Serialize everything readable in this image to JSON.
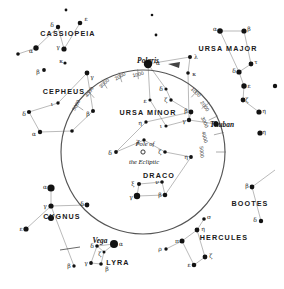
{
  "chart_data": {
    "type": "scatter",
    "xlabel": "",
    "ylabel": "",
    "grid": false,
    "legend_position": "none",
    "precession_circle": {
      "center_label": "Pole of the Ecliptic",
      "center_x": 143,
      "center_y": 152,
      "radius": 82,
      "year_ticks": [
        "1000",
        "2000",
        "3000",
        "4000",
        "5000",
        "2000",
        "3000",
        "4000",
        "5000"
      ]
    },
    "constellations": [
      {
        "name": "CASSIOPEIA",
        "x": 68,
        "y": 33
      },
      {
        "name": "CEPHEUS",
        "x": 64,
        "y": 91
      },
      {
        "name": "URSA MAJOR",
        "x": 228,
        "y": 48
      },
      {
        "name": "URSA MINOR",
        "x": 148,
        "y": 112
      },
      {
        "name": "DRACO",
        "x": 159,
        "y": 175
      },
      {
        "name": "BOOTES",
        "x": 250,
        "y": 203
      },
      {
        "name": "HERCULES",
        "x": 224,
        "y": 237
      },
      {
        "name": "CYGNUS",
        "x": 62,
        "y": 216
      },
      {
        "name": "LYRA",
        "x": 118,
        "y": 262
      }
    ],
    "named_stars": [
      {
        "name": "Polaris",
        "x": 148,
        "y": 60
      },
      {
        "name": "Thuban",
        "x": 222,
        "y": 124
      },
      {
        "name": "Vega",
        "x": 100,
        "y": 240
      }
    ],
    "pole_marker": {
      "label_line1": "Pole of",
      "label_line2": "the Ecliptic",
      "x": 143,
      "y": 152
    },
    "star_labels": [
      {
        "g": "ε",
        "x": 86,
        "y": 18
      },
      {
        "g": "δ",
        "x": 52,
        "y": 24
      },
      {
        "g": "γ",
        "x": 58,
        "y": 46
      },
      {
        "g": "α",
        "x": 31,
        "y": 50
      },
      {
        "g": "κ",
        "x": 61,
        "y": 60
      },
      {
        "g": "β",
        "x": 38,
        "y": 71
      },
      {
        "g": "γ",
        "x": 92,
        "y": 76
      },
      {
        "g": "ι",
        "x": 52,
        "y": 103
      },
      {
        "g": "δ",
        "x": 24,
        "y": 113
      },
      {
        "g": "β",
        "x": 88,
        "y": 113
      },
      {
        "g": "α",
        "x": 34,
        "y": 133
      },
      {
        "g": "α",
        "x": 215,
        "y": 28
      },
      {
        "g": "β",
        "x": 249,
        "y": 28
      },
      {
        "g": "τ",
        "x": 256,
        "y": 61
      },
      {
        "g": "δ",
        "x": 234,
        "y": 70
      },
      {
        "g": "ε",
        "x": 249,
        "y": 85
      },
      {
        "g": "ζ",
        "x": 247,
        "y": 99
      },
      {
        "g": "η",
        "x": 264,
        "y": 110
      },
      {
        "g": "λ",
        "x": 196,
        "y": 56
      },
      {
        "g": "κ",
        "x": 194,
        "y": 73
      },
      {
        "g": "α",
        "x": 158,
        "y": 62
      },
      {
        "g": "δ",
        "x": 161,
        "y": 88
      },
      {
        "g": "ε",
        "x": 145,
        "y": 100
      },
      {
        "g": "ζ",
        "x": 166,
        "y": 99
      },
      {
        "g": "β",
        "x": 186,
        "y": 110
      },
      {
        "g": "γ",
        "x": 184,
        "y": 120
      },
      {
        "g": "η",
        "x": 140,
        "y": 122
      },
      {
        "g": "ι",
        "x": 161,
        "y": 125
      },
      {
        "g": "χ",
        "x": 138,
        "y": 140
      },
      {
        "g": "δ",
        "x": 110,
        "y": 152
      },
      {
        "g": "ζ",
        "x": 160,
        "y": 151
      },
      {
        "g": "η",
        "x": 186,
        "y": 156
      },
      {
        "g": "ξ",
        "x": 133,
        "y": 183
      },
      {
        "g": "ν",
        "x": 157,
        "y": 181
      },
      {
        "g": "γ",
        "x": 131,
        "y": 196
      },
      {
        "g": "β",
        "x": 160,
        "y": 194
      },
      {
        "g": "α",
        "x": 45,
        "y": 186
      },
      {
        "g": "γ",
        "x": 45,
        "y": 205
      },
      {
        "g": "δ",
        "x": 82,
        "y": 203
      },
      {
        "g": "ε",
        "x": 21,
        "y": 228
      },
      {
        "g": "β",
        "x": 69,
        "y": 265
      },
      {
        "g": "α",
        "x": 121,
        "y": 243
      },
      {
        "g": "δ",
        "x": 92,
        "y": 245
      },
      {
        "g": "ζ",
        "x": 100,
        "y": 253
      },
      {
        "g": "γ",
        "x": 86,
        "y": 262
      },
      {
        "g": "β",
        "x": 107,
        "y": 268
      },
      {
        "g": "σ",
        "x": 209,
        "y": 216
      },
      {
        "g": "η",
        "x": 203,
        "y": 228
      },
      {
        "g": "π",
        "x": 177,
        "y": 240
      },
      {
        "g": "ρ",
        "x": 160,
        "y": 248
      },
      {
        "g": "ζ",
        "x": 211,
        "y": 255
      },
      {
        "g": "ε",
        "x": 189,
        "y": 264
      },
      {
        "g": "β",
        "x": 247,
        "y": 185
      },
      {
        "g": "δ",
        "x": 255,
        "y": 219
      },
      {
        "g": "η",
        "x": 264,
        "y": 131
      }
    ],
    "stars": [
      {
        "x": 80,
        "y": 23,
        "m": 2.3
      },
      {
        "x": 58,
        "y": 27,
        "m": 2.2
      },
      {
        "x": 64,
        "y": 49,
        "m": 2.6
      },
      {
        "x": 36,
        "y": 48,
        "m": 2.7
      },
      {
        "x": 65,
        "y": 63,
        "m": 1.6
      },
      {
        "x": 18,
        "y": 54,
        "m": 1.8
      },
      {
        "x": 44,
        "y": 70,
        "m": 1.9
      },
      {
        "x": 87,
        "y": 73,
        "m": 2.4
      },
      {
        "x": 58,
        "y": 103,
        "m": 1.7
      },
      {
        "x": 29,
        "y": 112,
        "m": 2.1
      },
      {
        "x": 93,
        "y": 111,
        "m": 2.0
      },
      {
        "x": 40,
        "y": 132,
        "m": 2.2
      },
      {
        "x": 72,
        "y": 131,
        "m": 1.8
      },
      {
        "x": 220,
        "y": 31,
        "m": 2.8
      },
      {
        "x": 244,
        "y": 31,
        "m": 2.6
      },
      {
        "x": 251,
        "y": 64,
        "m": 2.4
      },
      {
        "x": 239,
        "y": 72,
        "m": 2.6
      },
      {
        "x": 244,
        "y": 86,
        "m": 2.7
      },
      {
        "x": 243,
        "y": 100,
        "m": 2.4
      },
      {
        "x": 259,
        "y": 112,
        "m": 2.6
      },
      {
        "x": 190,
        "y": 57,
        "m": 2.0
      },
      {
        "x": 188,
        "y": 73,
        "m": 1.8
      },
      {
        "x": 148,
        "y": 64,
        "m": 4.2
      },
      {
        "x": 166,
        "y": 89,
        "m": 1.6
      },
      {
        "x": 150,
        "y": 100,
        "m": 1.6
      },
      {
        "x": 171,
        "y": 100,
        "m": 1.7
      },
      {
        "x": 191,
        "y": 112,
        "m": 2.4
      },
      {
        "x": 189,
        "y": 120,
        "m": 2.2
      },
      {
        "x": 146,
        "y": 122,
        "m": 1.7
      },
      {
        "x": 166,
        "y": 126,
        "m": 1.6
      },
      {
        "x": 144,
        "y": 140,
        "m": 1.7
      },
      {
        "x": 116,
        "y": 152,
        "m": 1.9
      },
      {
        "x": 165,
        "y": 152,
        "m": 1.8
      },
      {
        "x": 191,
        "y": 157,
        "m": 1.9
      },
      {
        "x": 216,
        "y": 124,
        "m": 2.7
      },
      {
        "x": 139,
        "y": 184,
        "m": 2.0
      },
      {
        "x": 162,
        "y": 182,
        "m": 1.8
      },
      {
        "x": 137,
        "y": 196,
        "m": 3.2
      },
      {
        "x": 165,
        "y": 195,
        "m": 2.3
      },
      {
        "x": 51,
        "y": 188,
        "m": 3.6
      },
      {
        "x": 51,
        "y": 206,
        "m": 2.6
      },
      {
        "x": 51,
        "y": 218,
        "m": 3.0
      },
      {
        "x": 87,
        "y": 205,
        "m": 2.4
      },
      {
        "x": 26,
        "y": 229,
        "m": 2.6
      },
      {
        "x": 74,
        "y": 266,
        "m": 1.7
      },
      {
        "x": 114,
        "y": 244,
        "m": 4.0
      },
      {
        "x": 97,
        "y": 246,
        "m": 1.8
      },
      {
        "x": 104,
        "y": 252,
        "m": 1.5
      },
      {
        "x": 91,
        "y": 263,
        "m": 1.9
      },
      {
        "x": 101,
        "y": 264,
        "m": 1.8
      },
      {
        "x": 204,
        "y": 219,
        "m": 1.8
      },
      {
        "x": 197,
        "y": 230,
        "m": 2.4
      },
      {
        "x": 182,
        "y": 241,
        "m": 2.5
      },
      {
        "x": 166,
        "y": 249,
        "m": 1.7
      },
      {
        "x": 205,
        "y": 257,
        "m": 2.4
      },
      {
        "x": 194,
        "y": 265,
        "m": 2.3
      },
      {
        "x": 252,
        "y": 187,
        "m": 2.4
      },
      {
        "x": 261,
        "y": 221,
        "m": 2.2
      },
      {
        "x": 260,
        "y": 133,
        "m": 2.6
      },
      {
        "x": 275,
        "y": 86,
        "m": 2.2
      },
      {
        "x": 66,
        "y": 10,
        "m": 1.4
      },
      {
        "x": 152,
        "y": 15,
        "m": 1.3
      },
      {
        "x": 156,
        "y": 35,
        "m": 1.4
      }
    ],
    "constellation_lines": [
      [
        [
          80,
          23
        ],
        [
          64,
          49
        ]
      ],
      [
        [
          64,
          49
        ],
        [
          58,
          27
        ]
      ],
      [
        [
          58,
          27
        ],
        [
          36,
          48
        ]
      ],
      [
        [
          36,
          48
        ],
        [
          18,
          54
        ]
      ],
      [
        [
          220,
          31
        ],
        [
          244,
          31
        ]
      ],
      [
        [
          244,
          31
        ],
        [
          251,
          64
        ]
      ],
      [
        [
          251,
          64
        ],
        [
          239,
          72
        ]
      ],
      [
        [
          239,
          72
        ],
        [
          220,
          31
        ]
      ],
      [
        [
          239,
          72
        ],
        [
          244,
          86
        ]
      ],
      [
        [
          244,
          86
        ],
        [
          243,
          100
        ]
      ],
      [
        [
          243,
          100
        ],
        [
          259,
          112
        ]
      ],
      [
        [
          148,
          64
        ],
        [
          166,
          89
        ]
      ],
      [
        [
          166,
          89
        ],
        [
          171,
          100
        ]
      ],
      [
        [
          171,
          100
        ],
        [
          191,
          112
        ]
      ],
      [
        [
          191,
          112
        ],
        [
          189,
          120
        ]
      ],
      [
        [
          189,
          120
        ],
        [
          166,
          126
        ]
      ],
      [
        [
          166,
          126
        ],
        [
          150,
          100
        ]
      ],
      [
        [
          150,
          100
        ],
        [
          148,
          64
        ]
      ],
      [
        [
          139,
          184
        ],
        [
          162,
          182
        ]
      ],
      [
        [
          162,
          182
        ],
        [
          165,
          195
        ]
      ],
      [
        [
          165,
          195
        ],
        [
          137,
          196
        ]
      ],
      [
        [
          137,
          196
        ],
        [
          139,
          184
        ]
      ],
      [
        [
          165,
          195
        ],
        [
          191,
          157
        ]
      ],
      [
        [
          191,
          157
        ],
        [
          165,
          152
        ]
      ],
      [
        [
          165,
          152
        ],
        [
          144,
          140
        ]
      ],
      [
        [
          144,
          140
        ],
        [
          116,
          152
        ]
      ],
      [
        [
          116,
          152
        ],
        [
          146,
          122
        ]
      ],
      [
        [
          146,
          122
        ],
        [
          191,
          112
        ]
      ],
      [
        [
          216,
          124
        ],
        [
          189,
          120
        ]
      ],
      [
        [
          51,
          188
        ],
        [
          51,
          206
        ]
      ],
      [
        [
          51,
          206
        ],
        [
          87,
          205
        ]
      ],
      [
        [
          51,
          206
        ],
        [
          26,
          229
        ]
      ],
      [
        [
          51,
          206
        ],
        [
          74,
          266
        ]
      ],
      [
        [
          114,
          244
        ],
        [
          97,
          246
        ]
      ],
      [
        [
          97,
          246
        ],
        [
          104,
          252
        ]
      ],
      [
        [
          104,
          252
        ],
        [
          114,
          244
        ]
      ],
      [
        [
          97,
          246
        ],
        [
          91,
          263
        ]
      ],
      [
        [
          91,
          263
        ],
        [
          101,
          264
        ]
      ],
      [
        [
          101,
          264
        ],
        [
          104,
          252
        ]
      ],
      [
        [
          204,
          219
        ],
        [
          197,
          230
        ]
      ],
      [
        [
          197,
          230
        ],
        [
          182,
          241
        ]
      ],
      [
        [
          182,
          241
        ],
        [
          166,
          249
        ]
      ],
      [
        [
          182,
          241
        ],
        [
          194,
          265
        ]
      ],
      [
        [
          194,
          265
        ],
        [
          205,
          257
        ]
      ],
      [
        [
          205,
          257
        ],
        [
          197,
          230
        ]
      ],
      [
        [
          252,
          187
        ],
        [
          275,
          170
        ]
      ],
      [
        [
          252,
          187
        ],
        [
          261,
          221
        ]
      ],
      [
        [
          58,
          103
        ],
        [
          29,
          112
        ]
      ],
      [
        [
          29,
          112
        ],
        [
          40,
          132
        ]
      ],
      [
        [
          40,
          132
        ],
        [
          72,
          131
        ]
      ],
      [
        [
          72,
          131
        ],
        [
          93,
          111
        ]
      ],
      [
        [
          93,
          111
        ],
        [
          87,
          73
        ]
      ],
      [
        [
          87,
          73
        ],
        [
          58,
          103
        ]
      ],
      [
        [
          190,
          57
        ],
        [
          188,
          73
        ]
      ],
      [
        [
          188,
          73
        ],
        [
          189,
          120
        ]
      ],
      [
        [
          190,
          57
        ],
        [
          148,
          64
        ]
      ]
    ],
    "year_tick_labels": [
      {
        "text": "5000",
        "x": 76,
        "y": 105,
        "rot": -62
      },
      {
        "text": "4000",
        "x": 89,
        "y": 92,
        "rot": -55
      },
      {
        "text": "3000",
        "x": 104,
        "y": 83,
        "rot": -44
      },
      {
        "text": "2000",
        "x": 120,
        "y": 76,
        "rot": -30
      },
      {
        "text": "1000",
        "x": 138,
        "y": 74,
        "rot": -14
      },
      {
        "text": "1000",
        "x": 196,
        "y": 92,
        "rot": 44
      },
      {
        "text": "2000",
        "x": 205,
        "y": 106,
        "rot": 54
      },
      {
        "text": "3000",
        "x": 205,
        "y": 122,
        "rot": 66
      },
      {
        "text": "4000",
        "x": 205,
        "y": 137,
        "rot": 76
      },
      {
        "text": "5000",
        "x": 202,
        "y": 152,
        "rot": 84
      }
    ]
  }
}
